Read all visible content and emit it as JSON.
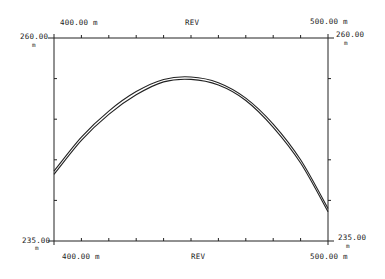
{
  "chart_data": {
    "type": "line",
    "title": "REV",
    "xlabel": "REV",
    "ylabel": "",
    "x_range_labels": {
      "min": "400.00 m",
      "max": "500.00 m"
    },
    "y_range_labels": {
      "min": "235.00",
      "max": "260.00",
      "unit": "m"
    },
    "xlim": [
      400,
      500
    ],
    "ylim": [
      235,
      260
    ],
    "x_divisions": 10,
    "y_divisions": 5,
    "grid": false,
    "series": [
      {
        "name": "profile-1",
        "x": [
          400,
          410,
          420,
          430,
          440,
          450,
          460,
          470,
          480,
          490,
          500
        ],
        "y": [
          243.2,
          247.4,
          250.6,
          253.0,
          254.6,
          254.9,
          254.2,
          252.3,
          249.0,
          244.6,
          238.6
        ]
      },
      {
        "name": "profile-2",
        "x": [
          400,
          410,
          420,
          430,
          440,
          450,
          460,
          470,
          480,
          490,
          500
        ],
        "y": [
          243.6,
          247.8,
          251.0,
          253.4,
          254.9,
          255.2,
          254.5,
          252.6,
          249.4,
          245.0,
          239.0
        ]
      }
    ]
  },
  "labels": {
    "top_left": "400.00 m",
    "top_center": "REV",
    "top_right": "500.00 m",
    "bottom_left": "400.00 m",
    "bottom_center": "REV",
    "bottom_right": "500.00 m",
    "left_top": "260.00",
    "left_bottom": "235.00",
    "right_top": "260.00",
    "right_bottom": "235.00",
    "unit": "m"
  }
}
